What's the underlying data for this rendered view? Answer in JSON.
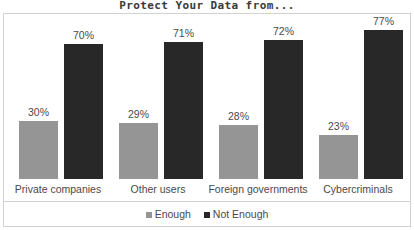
{
  "chart_data": {
    "type": "bar",
    "title": "Protect Your Data from...",
    "xlabel": "",
    "ylabel": "",
    "ylim": [
      0,
      100
    ],
    "grid": false,
    "legend_position": "bottom",
    "categories": [
      "Private companies",
      "Other users",
      "Foreign governments",
      "Cybercriminals"
    ],
    "series": [
      {
        "name": "Enough",
        "color": "#959595",
        "values": [
          30,
          29,
          28,
          23
        ],
        "labels": [
          "30%",
          "29%",
          "28%",
          "23%"
        ]
      },
      {
        "name": "Not Enough",
        "color": "#282828",
        "values": [
          70,
          71,
          72,
          77
        ],
        "labels": [
          "70%",
          "71%",
          "72%",
          "77%"
        ]
      }
    ]
  },
  "legend": {
    "items": [
      {
        "label": "Enough",
        "swatch": "legend-swatch-enough"
      },
      {
        "label": "Not Enough",
        "swatch": "legend-swatch-not-enough"
      }
    ]
  },
  "colors": {
    "enough": "#959595",
    "not_enough": "#282828",
    "frame": "#d2d2d2",
    "text": "#4a4a4a",
    "title_text": "#3a3a3a",
    "background": "#ffffff"
  }
}
